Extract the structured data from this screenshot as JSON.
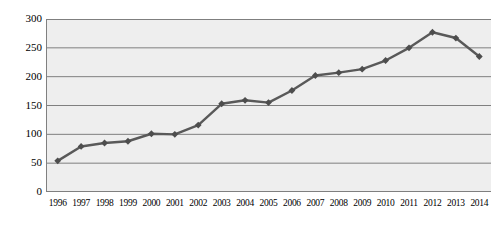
{
  "chart_data": {
    "type": "line",
    "title": "",
    "subtitle": "",
    "xlabel": "",
    "ylabel": "",
    "categories": [
      "1996",
      "1997",
      "1998",
      "1999",
      "2000",
      "2001",
      "2002",
      "2003",
      "2004",
      "2005",
      "2006",
      "2007",
      "2008",
      "2009",
      "2010",
      "2011",
      "2012",
      "2013",
      "2014"
    ],
    "values": [
      54,
      79,
      85,
      88,
      101,
      100,
      116,
      153,
      159,
      155,
      176,
      202,
      207,
      213,
      228,
      250,
      277,
      267,
      235
    ],
    "ylim": [
      0,
      300
    ],
    "ytick_values": [
      0,
      50,
      100,
      150,
      200,
      250,
      300
    ],
    "ytick_labels": [
      "0",
      "50",
      "100",
      "150",
      "200",
      "250",
      "300"
    ],
    "grid": {
      "horizontal": true,
      "vertical": false
    },
    "legend": {
      "visible": false,
      "position": "none",
      "entries": []
    },
    "series": [
      {
        "name": "Series 1",
        "marker": "diamond",
        "values": [
          54,
          79,
          85,
          88,
          101,
          100,
          116,
          153,
          159,
          155,
          176,
          202,
          207,
          213,
          228,
          250,
          277,
          267,
          235
        ]
      }
    ],
    "annotations": []
  },
  "style": {
    "line_color": "#595959",
    "marker_color": "#4d4d4d",
    "plot_background": "#eeeeee",
    "gridline_color": "#7f7f7f",
    "axis_color": "#808080",
    "text_color": "#000000",
    "page_background": "#ffffff"
  }
}
